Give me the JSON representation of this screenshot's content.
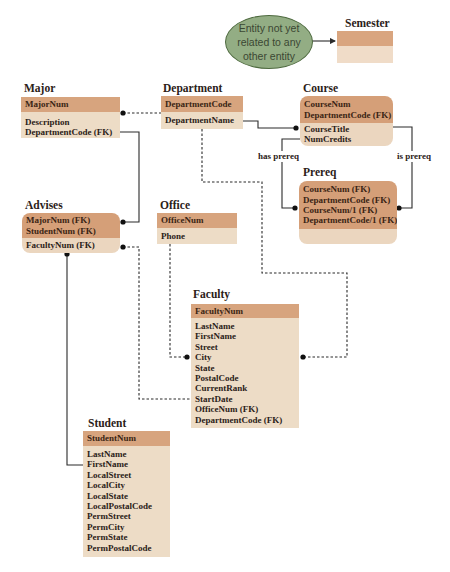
{
  "note": {
    "lines": [
      "Entity not yet",
      "related to any",
      "other entity"
    ]
  },
  "entities": {
    "semester": {
      "title": "Semester",
      "key": [],
      "attributes": []
    },
    "major": {
      "title": "Major",
      "key": [
        "MajorNum"
      ],
      "attributes": [
        "Description",
        "DepartmentCode (FK)"
      ]
    },
    "department": {
      "title": "Department",
      "key": [
        "DepartmentCode"
      ],
      "attributes": [
        "DepartmentName"
      ]
    },
    "course": {
      "title": "Course",
      "key": [
        "CourseNum",
        "DepartmentCode (FK)"
      ],
      "attributes": [
        "CourseTitle",
        "NumCredits"
      ]
    },
    "prereq": {
      "title": "Prereq",
      "key": [
        "CourseNum (FK)",
        "DepartmentCode (FK)",
        "CourseNum/1 (FK)",
        "DepartmentCode/1 (FK)"
      ],
      "attributes": []
    },
    "advises": {
      "title": "Advises",
      "key": [
        "MajorNum (FK)",
        "StudentNum (FK)"
      ],
      "attributes": [
        "FacultyNum (FK)"
      ]
    },
    "office": {
      "title": "Office",
      "key": [
        "OfficeNum"
      ],
      "attributes": [
        "Phone"
      ]
    },
    "faculty": {
      "title": "Faculty",
      "key": [
        "FacultyNum"
      ],
      "attributes": [
        "LastName",
        "FirstName",
        "Street",
        "City",
        "State",
        "PostalCode",
        "CurrentRank",
        "StartDate",
        "OfficeNum (FK)",
        "DepartmentCode (FK)"
      ]
    },
    "student": {
      "title": "Student",
      "key": [
        "StudentNum"
      ],
      "attributes": [
        "LastName",
        "FirstName",
        "LocalStreet",
        "LocalCity",
        "LocalState",
        "LocalPostalCode",
        "PermStreet",
        "PermCity",
        "PermState",
        "PermPostalCode"
      ]
    }
  },
  "relationship_labels": {
    "has_prereq": "has prereq",
    "is_prereq": "is prereq"
  },
  "colors": {
    "key_header": "#d7a47e",
    "attribute_body": "#eddcc6",
    "note_fill": "#93ad84",
    "note_border": "#4f6b40",
    "line": "#2b2b2b"
  }
}
